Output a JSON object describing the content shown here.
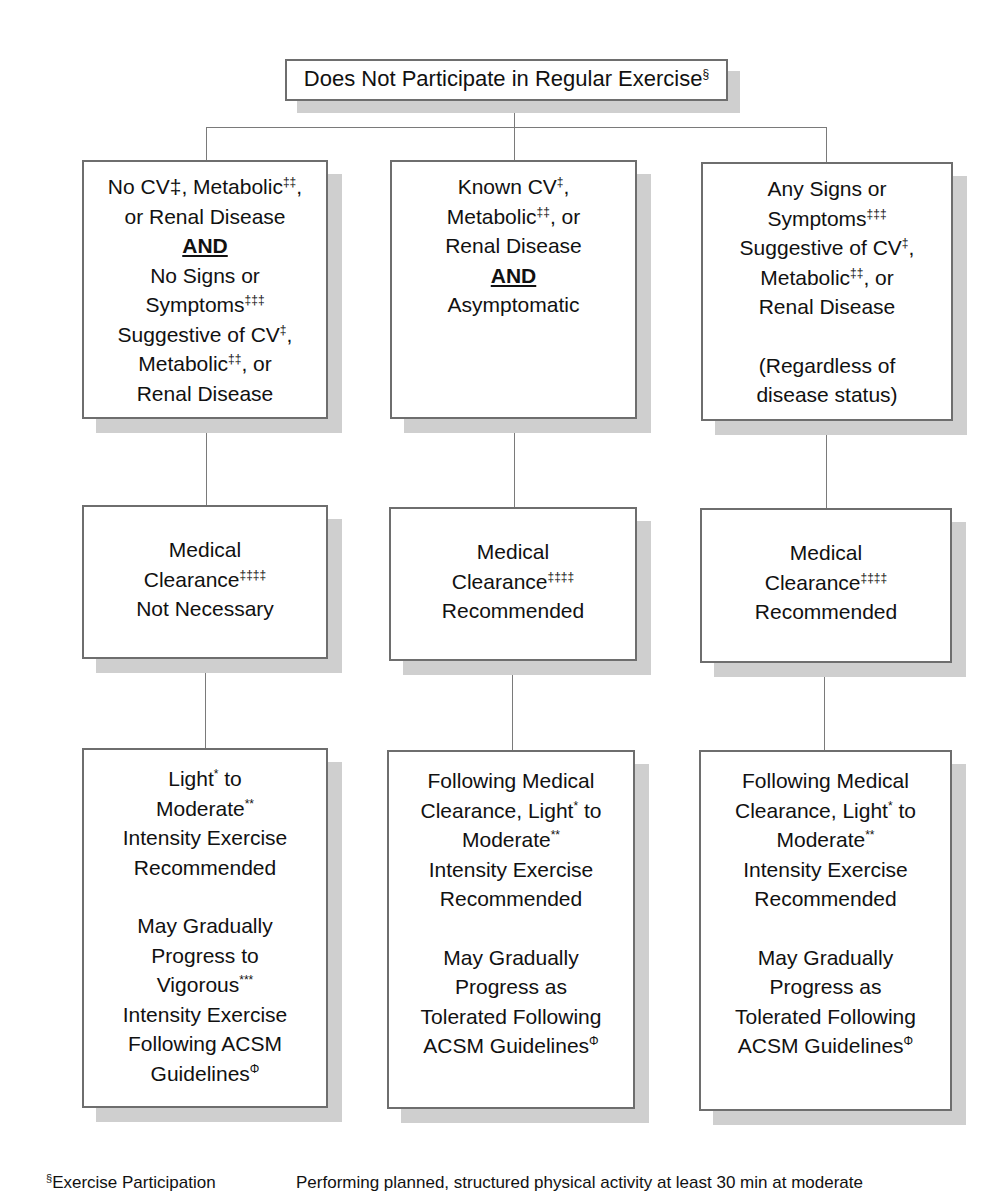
{
  "root": {
    "text": "Does Not Participate in Regular Exercise",
    "sup": "§"
  },
  "columns": [
    {
      "condition": {
        "l1": "No CV‡, Metabolic",
        "l1_sup": "‡‡",
        "l1_end": ",",
        "l2": "or Renal Disease",
        "and": "AND",
        "l3": "No Signs or",
        "l4": "Symptoms",
        "l4_sup": "‡‡‡",
        "l5": "Suggestive of CV",
        "l5_sup": "‡",
        "l5_end": ",",
        "l6": "Metabolic",
        "l6_sup": "‡‡",
        "l6_end": ", or",
        "l7": "Renal Disease"
      },
      "clearance": {
        "l1": "Medical",
        "l2": "Clearance",
        "l2_sup": "‡‡‡‡",
        "l3": "Not Necessary"
      },
      "exercise": {
        "l1": "Light",
        "l1_sup": "*",
        "l1_end": " to",
        "l2": "Moderate",
        "l2_sup": "**",
        "l3": "Intensity Exercise",
        "l4": "Recommended",
        "l5": "May Gradually",
        "l6": "Progress to",
        "l7": "Vigorous",
        "l7_sup": "***",
        "l8": "Intensity Exercise",
        "l9": "Following ACSM",
        "l10": "Guidelines",
        "l10_sup": "Φ"
      }
    },
    {
      "condition": {
        "l1": "Known CV",
        "l1_sup": "‡",
        "l1_end": ",",
        "l2": "Metabolic",
        "l2_sup": "‡‡",
        "l2_end": ", or",
        "l3": "Renal Disease",
        "and": "AND",
        "l4": "Asymptomatic"
      },
      "clearance": {
        "l1": "Medical",
        "l2": "Clearance",
        "l2_sup": "‡‡‡‡",
        "l3": "Recommended"
      },
      "exercise": {
        "l1": "Following Medical",
        "l2": "Clearance, Light",
        "l2_sup": "*",
        "l2_end": " to",
        "l3": "Moderate",
        "l3_sup": "**",
        "l4": "Intensity Exercise",
        "l5": "Recommended",
        "l6": "May Gradually",
        "l7": "Progress as",
        "l8": "Tolerated Following",
        "l9": "ACSM Guidelines",
        "l9_sup": "Φ"
      }
    },
    {
      "condition": {
        "l1": "Any Signs or",
        "l2": "Symptoms",
        "l2_sup": "‡‡‡",
        "l3": "Suggestive of CV",
        "l3_sup": "‡",
        "l3_end": ",",
        "l4": "Metabolic",
        "l4_sup": "‡‡",
        "l4_end": ", or",
        "l5": "Renal Disease",
        "l6": "(Regardless of",
        "l7": "disease status)"
      },
      "clearance": {
        "l1": "Medical",
        "l2": "Clearance",
        "l2_sup": "‡‡‡‡",
        "l3": "Recommended"
      },
      "exercise": {
        "l1": "Following Medical",
        "l2": "Clearance, Light",
        "l2_sup": "*",
        "l2_end": " to",
        "l3": "Moderate",
        "l3_sup": "**",
        "l4": "Intensity Exercise",
        "l5": "Recommended",
        "l6": "May Gradually",
        "l7": "Progress as",
        "l8": "Tolerated Following",
        "l9": "ACSM Guidelines",
        "l9_sup": "Φ"
      }
    }
  ],
  "footnote": {
    "sup": "§",
    "term": "Exercise Participation",
    "definition": "Performing planned, structured physical activity at least 30 min at moderate"
  }
}
